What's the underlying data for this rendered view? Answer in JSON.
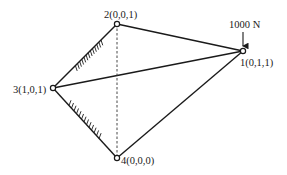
{
  "diagram": {
    "type": "space-truss",
    "nodes": [
      {
        "id": "1",
        "label": "1(0,1,1)"
      },
      {
        "id": "2",
        "label": "2(0,0,1)"
      },
      {
        "id": "3",
        "label": "3(1,0,1)"
      },
      {
        "id": "4",
        "label": "4(0,0,0)"
      }
    ],
    "members": [
      {
        "from": "2",
        "to": "1",
        "style": "solid"
      },
      {
        "from": "3",
        "to": "1",
        "style": "solid"
      },
      {
        "from": "4",
        "to": "1",
        "style": "solid"
      },
      {
        "from": "2",
        "to": "4",
        "style": "dashed"
      }
    ],
    "supports": [
      {
        "from": "3",
        "to": "2",
        "label": "wall-support-3-2"
      },
      {
        "from": "3",
        "to": "4",
        "label": "wall-support-3-4"
      }
    ],
    "load": {
      "node": "1",
      "label": "1000 N",
      "direction": "down"
    }
  }
}
